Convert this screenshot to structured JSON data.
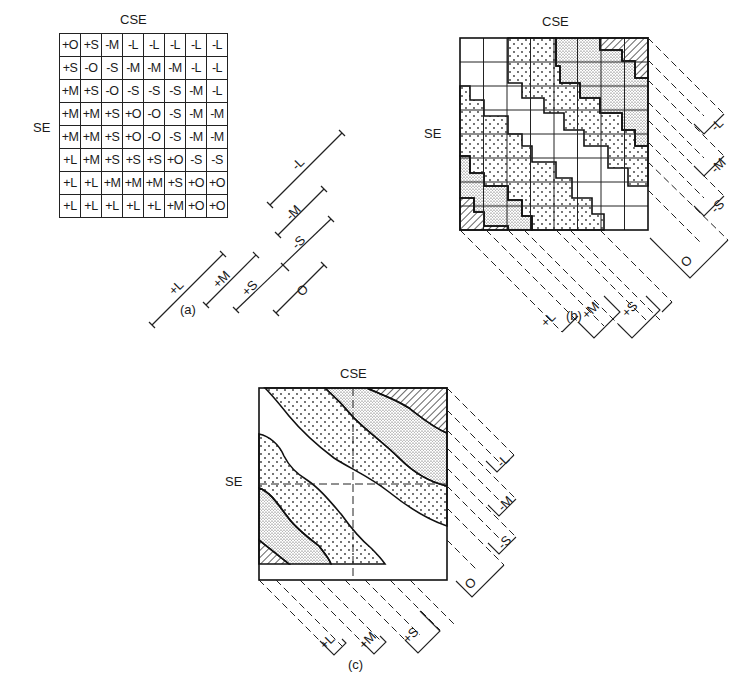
{
  "panel_a": {
    "axis_top": "CSE",
    "axis_left": "SE",
    "caption": "(a)",
    "rows": [
      [
        "+O",
        "+S",
        "-M",
        "-L",
        "-L",
        "-L",
        "-L",
        "-L"
      ],
      [
        "+S",
        "-O",
        "-S",
        "-M",
        "-M",
        "-M",
        "-L",
        "-L"
      ],
      [
        "+M",
        "+S",
        "-O",
        "-S",
        "-S",
        "-S",
        "-M",
        "-L"
      ],
      [
        "+M",
        "+M",
        "+S",
        "+O",
        "-O",
        "-S",
        "-M",
        "-M"
      ],
      [
        "+M",
        "+M",
        "+S",
        "+O",
        "-O",
        "-S",
        "-M",
        "-M"
      ],
      [
        "+L",
        "+M",
        "+S",
        "+S",
        "+S",
        "+O",
        "-S",
        "-S"
      ],
      [
        "+L",
        "+L",
        "+M",
        "+M",
        "+M",
        "+S",
        "+O",
        "+O"
      ],
      [
        "+L",
        "+L",
        "+L",
        "+L",
        "+L",
        "+M",
        "+O",
        "+O"
      ]
    ],
    "legend": [
      "-L",
      "-M",
      "-S",
      "O",
      "+S",
      "+M",
      "+L"
    ]
  },
  "panel_b": {
    "axis_top": "CSE",
    "axis_left": "SE",
    "caption": "(b)",
    "right_labels": [
      "-L",
      "-M",
      "-S",
      "O"
    ],
    "bottom_labels": [
      "+L",
      "+M",
      "+S"
    ]
  },
  "panel_c": {
    "axis_top": "CSE",
    "axis_left": "SE",
    "caption": "(c)",
    "right_labels": [
      "-L",
      "-M",
      "-S",
      "O"
    ],
    "bottom_labels": [
      "+L",
      "+M",
      "+S"
    ]
  }
}
